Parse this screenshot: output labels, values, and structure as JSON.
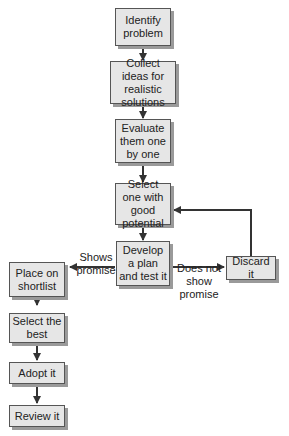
{
  "diagram": {
    "type": "flowchart",
    "nodes": {
      "identify": "Identify problem",
      "collect": "Collect ideas for realistic solutions",
      "evaluate": "Evaluate them one by one",
      "select_one": "Select one with good potential",
      "develop": "Develop a plan and test it",
      "discard": "Discard it",
      "shortlist": "Place on shortlist",
      "select_best": "Select the best",
      "adopt": "Adopt it",
      "review": "Review it"
    },
    "edge_labels": {
      "shows_promise": "Shows promise",
      "does_not_show_promise": "Does not show promise"
    },
    "edges": [
      [
        "identify",
        "collect"
      ],
      [
        "collect",
        "evaluate"
      ],
      [
        "evaluate",
        "select_one"
      ],
      [
        "select_one",
        "develop"
      ],
      [
        "develop",
        "shortlist",
        "Shows promise"
      ],
      [
        "develop",
        "discard",
        "Does not show promise"
      ],
      [
        "discard",
        "select_one"
      ],
      [
        "shortlist",
        "select_best"
      ],
      [
        "select_best",
        "adopt"
      ],
      [
        "adopt",
        "review"
      ]
    ]
  }
}
